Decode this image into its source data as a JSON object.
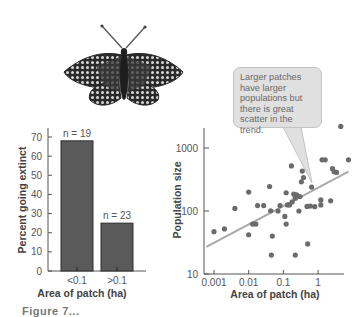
{
  "figure": {
    "butterfly_icon": "checkerspot-butterfly",
    "caption_truncated": "Figure 7..."
  },
  "colors": {
    "bar_fill": "#5a5a5a",
    "bar_edge": "#2e2e2e",
    "point": "#6b6b6b",
    "trendline": "#a8a8a8",
    "axis": "#555555",
    "callout_fill": "#e0e0e0",
    "callout_border": "#c4c4c4",
    "text": "#555555"
  },
  "callout": {
    "lines": [
      "Larger patches",
      "have larger",
      "populations but",
      "there is great",
      "scatter in the trend."
    ]
  },
  "chart_data": [
    {
      "type": "bar",
      "title": "",
      "xlabel": "Area of patch (ha)",
      "ylabel": "Percent going extinct",
      "categories": [
        "<0.1",
        ">0.1"
      ],
      "values": [
        68,
        25
      ],
      "annotations": [
        "n = 19",
        "n = 23"
      ],
      "ylim": [
        0,
        70
      ],
      "yticks": [
        0,
        10,
        20,
        30,
        40,
        50,
        60,
        70
      ],
      "grid": false,
      "legend": null
    },
    {
      "type": "scatter",
      "title": "",
      "xlabel": "Area of patch (ha)",
      "ylabel": "Population size",
      "xscale": "log",
      "yscale": "log",
      "xticks": [
        0.001,
        0.01,
        0.1,
        1
      ],
      "xtick_labels": [
        "0.001",
        "0.01",
        "0.1",
        "1"
      ],
      "yticks": [
        10,
        100,
        1000
      ],
      "ytick_labels": [
        "10",
        "100",
        "1000"
      ],
      "xlim": [
        0.0006,
        8
      ],
      "ylim": [
        10,
        3000
      ],
      "grid": false,
      "legend": null,
      "trendline": {
        "x": [
          0.0006,
          7.5
        ],
        "y": [
          27,
          420
        ]
      },
      "annotation": "Larger patches have larger populations but there is great scatter in the trend.",
      "points": [
        {
          "x": 0.001,
          "y": 47
        },
        {
          "x": 0.002,
          "y": 52
        },
        {
          "x": 0.004,
          "y": 110
        },
        {
          "x": 0.01,
          "y": 42
        },
        {
          "x": 0.01,
          "y": 200
        },
        {
          "x": 0.013,
          "y": 62
        },
        {
          "x": 0.016,
          "y": 62
        },
        {
          "x": 0.018,
          "y": 122
        },
        {
          "x": 0.027,
          "y": 122
        },
        {
          "x": 0.04,
          "y": 245
        },
        {
          "x": 0.043,
          "y": 101
        },
        {
          "x": 0.045,
          "y": 20
        },
        {
          "x": 0.048,
          "y": 40
        },
        {
          "x": 0.07,
          "y": 100
        },
        {
          "x": 0.08,
          "y": 122
        },
        {
          "x": 0.11,
          "y": 82
        },
        {
          "x": 0.12,
          "y": 195
        },
        {
          "x": 0.12,
          "y": 62
        },
        {
          "x": 0.13,
          "y": 125
        },
        {
          "x": 0.15,
          "y": 125
        },
        {
          "x": 0.17,
          "y": 520
        },
        {
          "x": 0.18,
          "y": 140
        },
        {
          "x": 0.2,
          "y": 185
        },
        {
          "x": 0.22,
          "y": 160
        },
        {
          "x": 0.22,
          "y": 20
        },
        {
          "x": 0.24,
          "y": 180
        },
        {
          "x": 0.28,
          "y": 100
        },
        {
          "x": 0.3,
          "y": 170
        },
        {
          "x": 0.33,
          "y": 290
        },
        {
          "x": 0.35,
          "y": 430
        },
        {
          "x": 0.38,
          "y": 340
        },
        {
          "x": 0.48,
          "y": 118
        },
        {
          "x": 0.5,
          "y": 30
        },
        {
          "x": 0.6,
          "y": 120
        },
        {
          "x": 0.65,
          "y": 240
        },
        {
          "x": 0.8,
          "y": 117
        },
        {
          "x": 1.2,
          "y": 125
        },
        {
          "x": 1.2,
          "y": 150
        },
        {
          "x": 1.3,
          "y": 650
        },
        {
          "x": 1.6,
          "y": 650
        },
        {
          "x": 2.3,
          "y": 145
        },
        {
          "x": 2.6,
          "y": 470
        },
        {
          "x": 2.9,
          "y": 420
        },
        {
          "x": 3.4,
          "y": 410
        },
        {
          "x": 4.5,
          "y": 2200
        },
        {
          "x": 7.5,
          "y": 650
        }
      ]
    }
  ]
}
